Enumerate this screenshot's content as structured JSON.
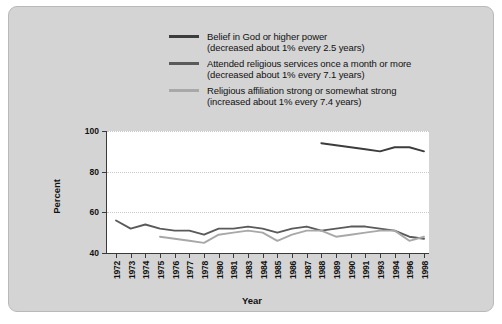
{
  "figure": {
    "background_color": "#d4d4d4",
    "plot_background_color": "#ffffff"
  },
  "chart_data": {
    "type": "line",
    "title": "",
    "xlabel": "Year",
    "ylabel": "Percent",
    "ylim": [
      40,
      100
    ],
    "yticks": [
      40,
      60,
      80,
      100
    ],
    "grid": "horizontal-dotted",
    "legend_position": "top-center",
    "x": [
      1972,
      1973,
      1974,
      1975,
      1976,
      1977,
      1978,
      1980,
      1981,
      1983,
      1984,
      1985,
      1986,
      1987,
      1988,
      1989,
      1990,
      1991,
      1993,
      1994,
      1996,
      1998
    ],
    "xtick_labels": [
      "1972",
      "1973",
      "1974",
      "1975",
      "1976",
      "1977",
      "1978",
      "1980",
      "1981",
      "1983",
      "1984",
      "1985",
      "1986",
      "1987",
      "1988",
      "1989",
      "1990",
      "1991",
      "1993",
      "1994",
      "1996",
      "1998"
    ],
    "series": [
      {
        "name": "Belief in God or higher power",
        "note": "(decreased about 1% every 2.5 years)",
        "color": "#3c3c3c",
        "x": [
          1988,
          1989,
          1990,
          1991,
          1993,
          1994,
          1996,
          1998
        ],
        "values": [
          94,
          93,
          92,
          91,
          90,
          92,
          92,
          90
        ]
      },
      {
        "name": "Attended religious services once a month or more",
        "note": "(decreased about 1% every 7.1 years)",
        "color": "#5a5a5a",
        "x": [
          1972,
          1973,
          1974,
          1975,
          1976,
          1977,
          1978,
          1980,
          1981,
          1983,
          1984,
          1985,
          1986,
          1987,
          1988,
          1989,
          1990,
          1991,
          1993,
          1994,
          1996,
          1998
        ],
        "values": [
          56,
          52,
          54,
          52,
          51,
          51,
          49,
          52,
          52,
          53,
          52,
          50,
          52,
          53,
          51,
          52,
          53,
          53,
          52,
          51,
          48,
          47
        ]
      },
      {
        "name": "Religious affiliation strong or somewhat strong",
        "note": "(increased about 1% every 7.4 years)",
        "color": "#a8a8a8",
        "x": [
          1975,
          1976,
          1977,
          1978,
          1980,
          1981,
          1983,
          1984,
          1985,
          1986,
          1987,
          1988,
          1989,
          1990,
          1991,
          1993,
          1994,
          1996,
          1998
        ],
        "values": [
          48,
          47,
          46,
          45,
          49,
          50,
          51,
          50,
          46,
          49,
          51,
          51,
          48,
          49,
          50,
          51,
          51,
          46,
          48
        ]
      }
    ]
  }
}
